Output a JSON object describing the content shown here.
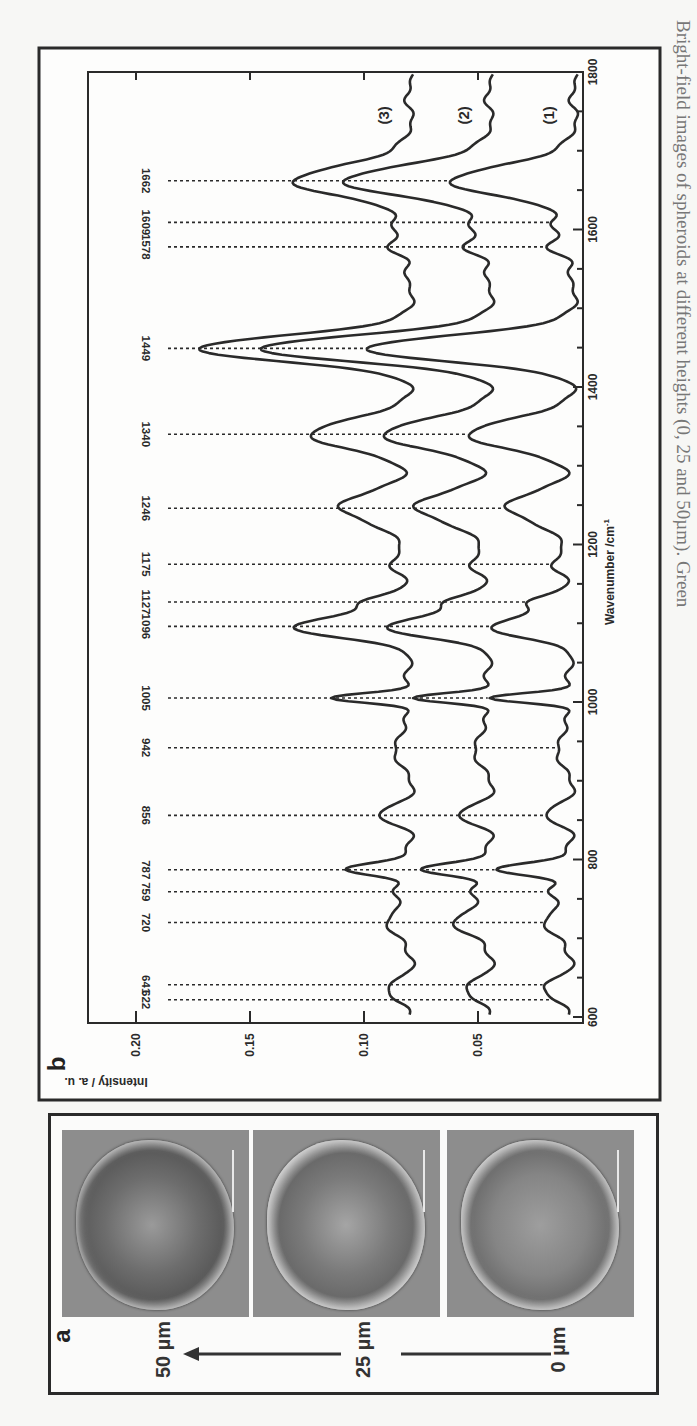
{
  "figure": {
    "orientation": "rotated 90 degrees (landscape figure on portrait page)",
    "caption_fragment": "Bright-field images of spheroids at different heights (0, 25 and 50µm). Green",
    "panel_a": {
      "letter": "a",
      "images": [
        {
          "depth_label": "50 µm",
          "description": "bright-field spheroid image"
        },
        {
          "depth_label": "25 µm",
          "description": "bright-field spheroid image"
        },
        {
          "depth_label": "0 µm",
          "description": "bright-field spheroid image"
        }
      ],
      "arrow": "depth increases from 0 µm to 50 µm"
    },
    "panel_b": {
      "letter": "b"
    }
  },
  "chart_data": {
    "type": "line",
    "title": "",
    "xlabel": "Wavenumber /cm-1",
    "xlabel_sup": "-1",
    "xlabel_base": "Wavenumber /cm",
    "ylabel": "Intensity / a. u.",
    "xlim": [
      600,
      1800
    ],
    "ylim": [
      0.004,
      0.221
    ],
    "x_ticks": [
      600,
      800,
      1000,
      1200,
      1400,
      1600,
      1800
    ],
    "x_tick_labels": [
      "600",
      "800",
      "1000",
      "1200",
      "1400",
      "1600",
      "1800"
    ],
    "y_ticks": [
      0.05,
      0.1,
      0.15,
      0.2
    ],
    "y_tick_labels": [
      "0.05",
      "0.10",
      "0.15",
      "0.20"
    ],
    "grid": false,
    "legend": "inline labels (1), (2), (3) at right end of each curve",
    "peak_labels": [
      622,
      641,
      720,
      759,
      787,
      856,
      942,
      1005,
      1096,
      1127,
      1175,
      1246,
      1340,
      1449,
      1578,
      1609,
      1662
    ],
    "series": [
      {
        "name": "(1)",
        "label": "(1)",
        "baseline": 0.009,
        "baseline_slope": -2e-06,
        "peaks": [
          [
            622,
            0.006,
            8
          ],
          [
            641,
            0.01,
            8
          ],
          [
            720,
            0.013,
            12
          ],
          [
            759,
            0.008,
            9
          ],
          [
            787,
            0.032,
            8
          ],
          [
            856,
            0.01,
            10
          ],
          [
            942,
            0.007,
            14
          ],
          [
            1005,
            0.036,
            6
          ],
          [
            1096,
            0.034,
            14
          ],
          [
            1127,
            0.018,
            8
          ],
          [
            1175,
            0.01,
            10
          ],
          [
            1246,
            0.028,
            20
          ],
          [
            1340,
            0.047,
            18
          ],
          [
            1449,
            0.092,
            16
          ],
          [
            1578,
            0.012,
            10
          ],
          [
            1609,
            0.008,
            8
          ],
          [
            1662,
            0.053,
            20
          ]
        ]
      },
      {
        "name": "(2)",
        "label": "(2)",
        "baseline": 0.045,
        "baseline_slope": 0.0,
        "peaks": [
          [
            622,
            0.006,
            8
          ],
          [
            641,
            0.009,
            8
          ],
          [
            720,
            0.018,
            12
          ],
          [
            759,
            0.007,
            9
          ],
          [
            787,
            0.03,
            8
          ],
          [
            856,
            0.013,
            10
          ],
          [
            942,
            0.008,
            14
          ],
          [
            1005,
            0.034,
            6
          ],
          [
            1096,
            0.044,
            14
          ],
          [
            1127,
            0.018,
            8
          ],
          [
            1175,
            0.01,
            10
          ],
          [
            1246,
            0.032,
            20
          ],
          [
            1340,
            0.048,
            18
          ],
          [
            1449,
            0.102,
            16
          ],
          [
            1578,
            0.012,
            10
          ],
          [
            1609,
            0.007,
            8
          ],
          [
            1662,
            0.063,
            20
          ]
        ]
      },
      {
        "name": "(3)",
        "label": "(3)",
        "baseline": 0.08,
        "baseline_slope": 0.0,
        "peaks": [
          [
            622,
            0.006,
            8
          ],
          [
            641,
            0.008,
            8
          ],
          [
            720,
            0.012,
            12
          ],
          [
            759,
            0.006,
            9
          ],
          [
            787,
            0.028,
            8
          ],
          [
            856,
            0.013,
            10
          ],
          [
            942,
            0.008,
            14
          ],
          [
            1005,
            0.035,
            6
          ],
          [
            1096,
            0.05,
            14
          ],
          [
            1127,
            0.019,
            8
          ],
          [
            1175,
            0.01,
            10
          ],
          [
            1246,
            0.03,
            20
          ],
          [
            1340,
            0.045,
            18
          ],
          [
            1449,
            0.094,
            16
          ],
          [
            1578,
            0.01,
            10
          ],
          [
            1609,
            0.006,
            8
          ],
          [
            1662,
            0.05,
            20
          ]
        ]
      }
    ],
    "peak_tip_values": {
      "(3)": {
        "1449": 0.174,
        "1340": 0.125,
        "1662": 0.129,
        "1096": 0.13,
        "1005": 0.115,
        "787": 0.108
      },
      "(2)": {
        "1449": 0.147,
        "1340": 0.093,
        "1662": 0.108,
        "1096": 0.089,
        "1005": 0.079,
        "787": 0.075
      },
      "(1)": {
        "1449": 0.101,
        "1340": 0.056,
        "1662": 0.062,
        "1096": 0.043,
        "1005": 0.045,
        "787": 0.041
      }
    }
  },
  "colors": {
    "ink": "#2a2a2a",
    "paper": "#f7f7f5",
    "micro_bg": "#8d8d8d",
    "caption": "#777777"
  }
}
